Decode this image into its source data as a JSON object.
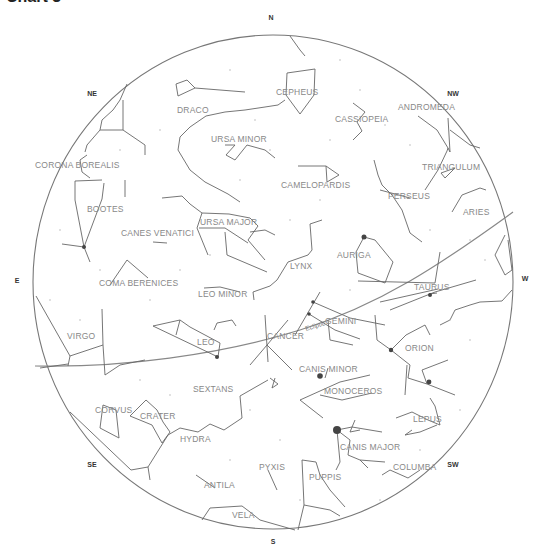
{
  "title": "Chart 3",
  "colors": {
    "horizon": "#777777",
    "lines": "#666666",
    "labels": "#888888",
    "stars": "#444444"
  },
  "compass": [
    {
      "label": "N",
      "x": 271,
      "y": 20
    },
    {
      "label": "NE",
      "x": 92,
      "y": 96
    },
    {
      "label": "NW",
      "x": 453,
      "y": 96
    },
    {
      "label": "E",
      "x": 17,
      "y": 283
    },
    {
      "label": "W",
      "x": 525,
      "y": 281
    },
    {
      "label": "SE",
      "x": 92,
      "y": 467
    },
    {
      "label": "SW",
      "x": 453,
      "y": 467
    },
    {
      "label": "S",
      "x": 273,
      "y": 544
    }
  ],
  "ecliptic_label": "Ecliptic",
  "constellations": [
    {
      "name": "DRACO",
      "x": 177,
      "y": 113
    },
    {
      "name": "CEPHEUS",
      "x": 276,
      "y": 95
    },
    {
      "name": "CASSIOPEIA",
      "x": 335,
      "y": 122
    },
    {
      "name": "ANDROMEDA",
      "x": 398,
      "y": 110
    },
    {
      "name": "URSA MINOR",
      "x": 211,
      "y": 142
    },
    {
      "name": "CORONA BOREALIS",
      "x": 35,
      "y": 168
    },
    {
      "name": "TRIANGULUM",
      "x": 422,
      "y": 170
    },
    {
      "name": "CAMELOPARDIS",
      "x": 281,
      "y": 188
    },
    {
      "name": "PERSEUS",
      "x": 388,
      "y": 199
    },
    {
      "name": "BOOTES",
      "x": 87,
      "y": 212
    },
    {
      "name": "ARIES",
      "x": 463,
      "y": 215
    },
    {
      "name": "URSA MAJOR",
      "x": 200,
      "y": 225
    },
    {
      "name": "CANES VENATICI",
      "x": 121,
      "y": 236
    },
    {
      "name": "AURIGA",
      "x": 337,
      "y": 258
    },
    {
      "name": "LYNX",
      "x": 290,
      "y": 269
    },
    {
      "name": "COMA BERENICES",
      "x": 99,
      "y": 286
    },
    {
      "name": "TAURUS",
      "x": 414,
      "y": 290
    },
    {
      "name": "LEO MINOR",
      "x": 198,
      "y": 297
    },
    {
      "name": "GEMINI",
      "x": 325,
      "y": 324
    },
    {
      "name": "VIRGO",
      "x": 67,
      "y": 339
    },
    {
      "name": "CANCER",
      "x": 267,
      "y": 339
    },
    {
      "name": "LEO",
      "x": 197,
      "y": 345
    },
    {
      "name": "ORION",
      "x": 405,
      "y": 351
    },
    {
      "name": "CANIS MINOR",
      "x": 299,
      "y": 372
    },
    {
      "name": "SEXTANS",
      "x": 193,
      "y": 392
    },
    {
      "name": "MONOCEROS",
      "x": 324,
      "y": 394
    },
    {
      "name": "CORVUS",
      "x": 95,
      "y": 413
    },
    {
      "name": "CRATER",
      "x": 140,
      "y": 419
    },
    {
      "name": "LEPUS",
      "x": 413,
      "y": 422
    },
    {
      "name": "HYDRA",
      "x": 180,
      "y": 442
    },
    {
      "name": "CANIS MAJOR",
      "x": 340,
      "y": 450
    },
    {
      "name": "PYXIS",
      "x": 259,
      "y": 470
    },
    {
      "name": "COLUMBA",
      "x": 393,
      "y": 470
    },
    {
      "name": "PUPPIS",
      "x": 309,
      "y": 480
    },
    {
      "name": "ANTILA",
      "x": 204,
      "y": 488
    },
    {
      "name": "VELA",
      "x": 232,
      "y": 518
    }
  ],
  "bright_stars": [
    {
      "name": "Sirius",
      "x": 337,
      "y": 430,
      "r": 4
    },
    {
      "name": "Procyon",
      "x": 320,
      "y": 376,
      "r": 2.8
    },
    {
      "name": "Capella",
      "x": 364,
      "y": 237,
      "r": 2.5
    },
    {
      "name": "Betelgeuse",
      "x": 391,
      "y": 350,
      "r": 2.2
    },
    {
      "name": "Rigel",
      "x": 429,
      "y": 382,
      "r": 2.4
    },
    {
      "name": "Arcturus",
      "x": 84,
      "y": 247,
      "r": 2
    },
    {
      "name": "Regulus",
      "x": 217,
      "y": 357,
      "r": 2
    },
    {
      "name": "Aldebaran",
      "x": 430,
      "y": 295,
      "r": 2
    },
    {
      "name": "Pollux",
      "x": 313,
      "y": 302,
      "r": 1.8
    },
    {
      "name": "Castor",
      "x": 309,
      "y": 314,
      "r": 1.8
    }
  ]
}
